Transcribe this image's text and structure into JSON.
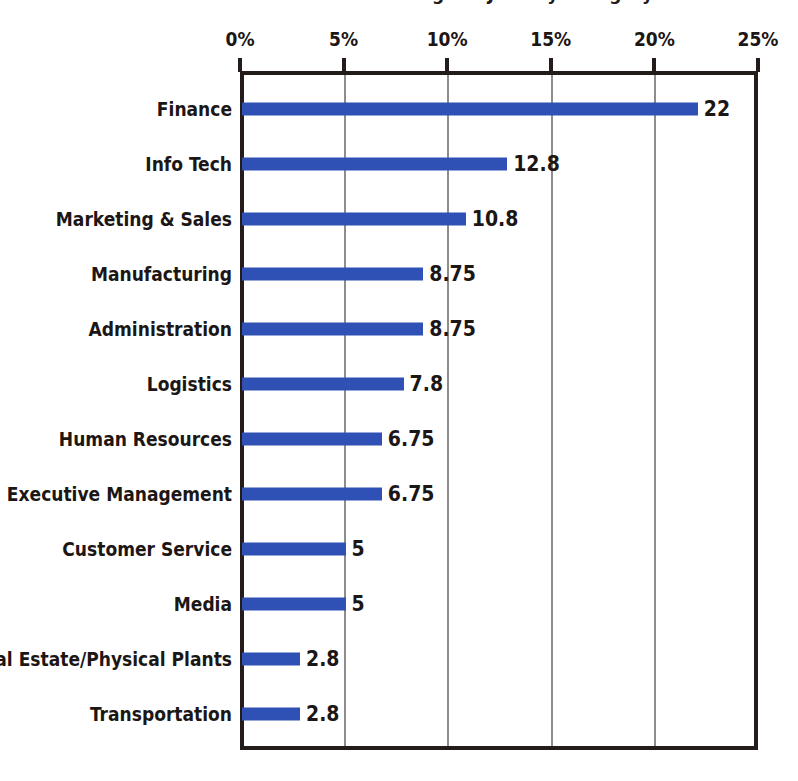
{
  "chart_data": {
    "type": "bar",
    "orientation": "horizontal",
    "title": "Percentage of Jobs by Category",
    "xlabel": "",
    "ylabel": "",
    "xlim": [
      0,
      25
    ],
    "grid": true,
    "legend": false,
    "tick_labels": [
      "0%",
      "5%",
      "10%",
      "15%",
      "20%",
      "25%"
    ],
    "tick_values": [
      0,
      5,
      10,
      15,
      20,
      25
    ],
    "categories": [
      "Finance",
      "Info Tech",
      "Marketing & Sales",
      "Manufacturing",
      "Administration",
      "Logistics",
      "Human Resources",
      "Executive Management",
      "Customer Service",
      "Media",
      "Real Estate/Physical Plants",
      "Transportation"
    ],
    "values": [
      22,
      12.8,
      10.8,
      8.75,
      8.75,
      7.8,
      6.75,
      6.75,
      5,
      5,
      2.8,
      2.8
    ],
    "value_labels": [
      "22",
      "12.8",
      "10.8",
      "8.75",
      "8.75",
      "7.8",
      "6.75",
      "6.75",
      "5",
      "5",
      "2.8",
      "2.8"
    ],
    "bar_color": "#2f51b5",
    "axis_color": "#231c1a",
    "grid_color": "#8d8d8d",
    "text_color": "#1c1614",
    "background": "#ffffff"
  }
}
